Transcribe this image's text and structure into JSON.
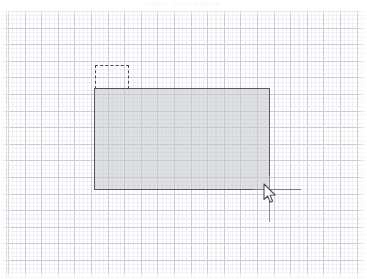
{
  "app": {
    "title": "Untitled - Drawing Canvas",
    "background_color": "#ffffff"
  },
  "canvas": {
    "grid": {
      "visible": true,
      "major_spacing_px": 16.6,
      "minor_spacing_px": 4.15,
      "major_color": "#c9cdd4",
      "minor_color": "#eef0f3"
    },
    "width_px": 367,
    "height_px": 270
  },
  "shapes": {
    "main_rectangle": {
      "name": "Rectangle",
      "x": 94,
      "y": 88,
      "width": 176,
      "height": 102,
      "stroke_color": "#58585c",
      "fill_color": "#c4c6c9",
      "stroke_style": "solid"
    },
    "preview_rectangle": {
      "name": "Selection Preview",
      "x": 95,
      "y": 65,
      "width": 34,
      "height": 24,
      "stroke_color": "#4a4a4e",
      "fill_color": "transparent",
      "stroke_style": "dashed"
    }
  },
  "guides": {
    "horizontal": {
      "x": 253,
      "y": 189,
      "length": 48,
      "color": "#7c7c80"
    },
    "vertical": {
      "x": 269,
      "y": 176,
      "length": 46,
      "color": "#8a8a8e"
    }
  },
  "pointer": {
    "icon": "arrow-cursor-icon",
    "x": 263,
    "y": 183
  }
}
